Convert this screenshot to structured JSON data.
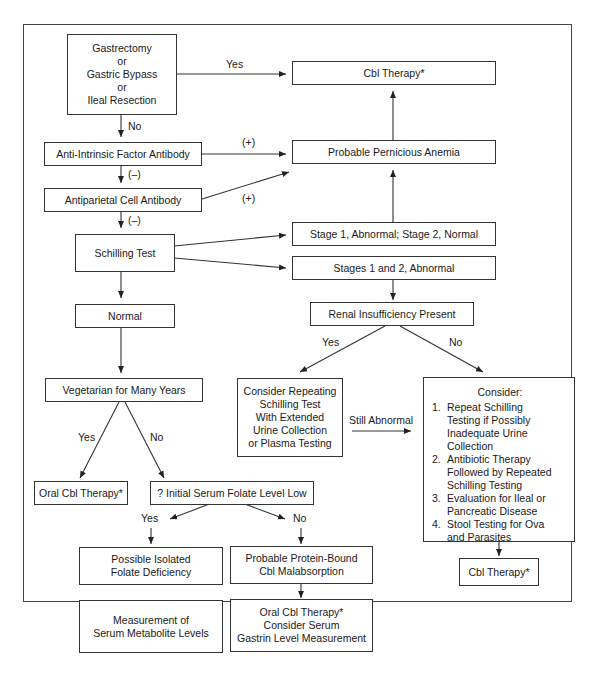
{
  "diagram": {
    "title": "",
    "nodes": {
      "gastrectomy": {
        "lines": [
          "Gastrectomy",
          "or",
          "Gastric Bypass",
          "or",
          "Ileal Resection"
        ]
      },
      "cbl_therapy_top": {
        "text": "Cbl Therapy*"
      },
      "anti_if": {
        "text": "Anti-Intrinsic Factor Antibody"
      },
      "probable_pa": {
        "text": "Probable Pernicious Anemia"
      },
      "antiparietal": {
        "text": "Antiparietal Cell Antibody"
      },
      "schilling": {
        "text": "Schilling Test"
      },
      "stage1_abnormal": {
        "text": "Stage 1, Abnormal; Stage 2, Normal"
      },
      "stages12_abnormal": {
        "text": "Stages 1 and 2, Abnormal"
      },
      "normal": {
        "text": "Normal"
      },
      "renal": {
        "text": "Renal Insufficiency Present"
      },
      "vegetarian": {
        "text": "Vegetarian for Many Years"
      },
      "repeat_schilling": {
        "lines": [
          "Consider Repeating",
          "Schilling Test",
          "With Extended",
          "Urine Collection",
          "or Plasma Testing"
        ]
      },
      "consider": {
        "heading": "Consider:",
        "items": [
          {
            "num": "1.",
            "lines": [
              "Repeat Schilling",
              "Testing if Possibly",
              "Inadequate Urine Collection"
            ]
          },
          {
            "num": "2.",
            "lines": [
              "Antibiotic Therapy",
              "Followed by Repeated",
              "Schilling Testing"
            ]
          },
          {
            "num": "3.",
            "lines": [
              "Evaluation for Ileal or",
              "Pancreatic Disease"
            ]
          },
          {
            "num": "4.",
            "lines": [
              "Stool Testing for Ova",
              "and Parasites"
            ]
          }
        ]
      },
      "oral_cbl": {
        "text": "Oral Cbl Therapy*"
      },
      "folate_low": {
        "text": "? Initial Serum Folate Level Low"
      },
      "cbl_therapy_bottom": {
        "text": "Cbl Therapy*"
      },
      "isolated_folate": {
        "lines": [
          "Possible Isolated",
          "Folate Deficiency"
        ]
      },
      "protein_bound": {
        "lines": [
          "Probable Protein-Bound",
          "Cbl Malabsorption"
        ]
      },
      "metabolite": {
        "lines": [
          "Measurement of",
          "Serum Metabolite Levels"
        ]
      },
      "oral_cbl_gastrin": {
        "lines": [
          "Oral Cbl Therapy*",
          "Consider Serum",
          "Gastrin Level Measurement"
        ]
      }
    },
    "edge_labels": {
      "gastrectomy_yes": "Yes",
      "gastrectomy_no": "No",
      "anti_if_pos": "(+)",
      "anti_if_neg": "(–)",
      "antiparietal_pos": "(+)",
      "antiparietal_neg": "(–)",
      "renal_yes": "Yes",
      "renal_no": "No",
      "still_abnormal": "Still Abnormal",
      "vegetarian_yes": "Yes",
      "vegetarian_no": "No",
      "folate_yes": "Yes",
      "folate_no": "No"
    }
  }
}
